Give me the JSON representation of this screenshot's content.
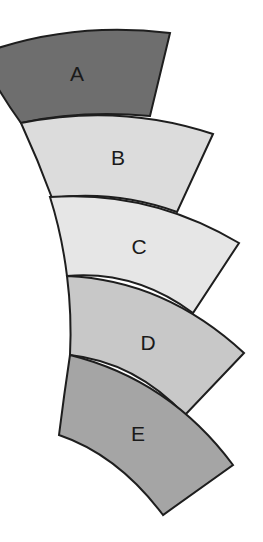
{
  "diagram": {
    "type": "stacked curved segments (annular sectors)",
    "segments": [
      {
        "id": "A",
        "label": "A",
        "fill": "#6e6e6e"
      },
      {
        "id": "B",
        "label": "B",
        "fill": "#dcdcdc"
      },
      {
        "id": "C",
        "label": "C",
        "fill": "#e6e6e6"
      },
      {
        "id": "D",
        "label": "D",
        "fill": "#c8c8c8"
      },
      {
        "id": "E",
        "label": "E",
        "fill": "#a5a5a5"
      }
    ],
    "stroke_color": "#1e1e1e",
    "background": "#ffffff"
  }
}
